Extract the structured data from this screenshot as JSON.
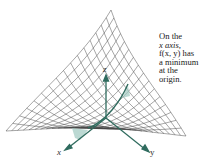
{
  "figure": {
    "caption_lines": [
      "On the",
      "x axis,",
      "f(x, y) has",
      "a minimum",
      "at the",
      "origin."
    ],
    "axis_labels": {
      "x": "x",
      "y": "y",
      "z": "z"
    },
    "colors": {
      "mesh": "#3a3a3a",
      "axes": "#2f6b5e",
      "highlight": "#9fc9c0",
      "text": "#1a1a1a"
    }
  }
}
